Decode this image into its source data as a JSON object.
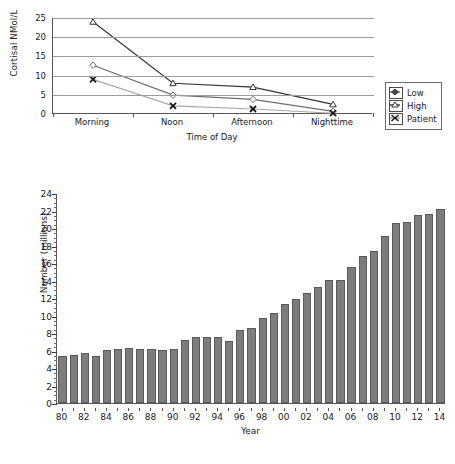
{
  "figure": {
    "partial_title": "",
    "background_color": "#ffffff"
  },
  "line_chart": {
    "ylabel": "Cortisal NMol/L",
    "xlabel": "Time of Day",
    "yticks": [
      "0",
      "5",
      "10",
      "15",
      "20",
      "25"
    ],
    "categories": [
      "Morning",
      "Noon",
      "Afternoon",
      "Nighttime"
    ],
    "legend": {
      "position": "right",
      "items": [
        {
          "label": "Low",
          "marker": "diamond-marker-icon",
          "color": "#6e6e6e"
        },
        {
          "label": "High",
          "marker": "triangle-marker-icon",
          "color": "#333333"
        },
        {
          "label": "Patient",
          "marker": "x-marker-icon",
          "color": "#a8a8a8"
        }
      ]
    }
  },
  "bar_chart": {
    "ylabel": "Number (millions)",
    "xlabel": "Year",
    "yticks": [
      "0",
      "2",
      "4",
      "6",
      "8",
      "10",
      "12",
      "14",
      "16",
      "18",
      "20",
      "22",
      "24"
    ],
    "xtick_labels": [
      "80",
      "82",
      "84",
      "86",
      "88",
      "90",
      "92",
      "94",
      "96",
      "98",
      "00",
      "02",
      "04",
      "06",
      "08",
      "10",
      "12",
      "14"
    ],
    "bar_color": "#7d7d7d",
    "bar_border_color": "#5a5a5a"
  },
  "chart_data": [
    {
      "type": "line",
      "title": "",
      "xlabel": "Time of Day",
      "ylabel": "Cortisal NMol/L",
      "categories": [
        "Morning",
        "Noon",
        "Afternoon",
        "Nighttime"
      ],
      "ylim": [
        0,
        25
      ],
      "ytick_step": 5,
      "grid": true,
      "legend": [
        "Low",
        "High",
        "Patient"
      ],
      "legend_position": "right-outside",
      "series": [
        {
          "name": "High",
          "marker": "triangle",
          "color": "#333333",
          "values": [
            24.0,
            8.0,
            7.0,
            2.5
          ]
        },
        {
          "name": "Low",
          "marker": "diamond",
          "color": "#6e6e6e",
          "values": [
            12.7,
            4.9,
            3.8,
            0.7
          ]
        },
        {
          "name": "Patient",
          "marker": "x",
          "color": "#a8a8a8",
          "values": [
            9.0,
            2.1,
            1.3,
            0.2
          ]
        }
      ]
    },
    {
      "type": "bar",
      "title": "",
      "xlabel": "Year",
      "ylabel": "Number (millions)",
      "ylim": [
        0,
        24
      ],
      "ytick_step": 2,
      "grid": false,
      "categories": [
        "80",
        "81",
        "82",
        "83",
        "84",
        "85",
        "86",
        "87",
        "88",
        "89",
        "90",
        "91",
        "92",
        "93",
        "94",
        "95",
        "96",
        "97",
        "98",
        "99",
        "00",
        "01",
        "02",
        "03",
        "04",
        "05",
        "06",
        "07",
        "08",
        "09",
        "10",
        "11",
        "12",
        "13",
        "14"
      ],
      "values": [
        5.4,
        5.5,
        5.7,
        5.4,
        6.1,
        6.2,
        6.3,
        6.2,
        6.2,
        6.1,
        6.2,
        7.2,
        7.5,
        7.6,
        7.6,
        7.1,
        8.3,
        8.6,
        9.7,
        10.3,
        11.3,
        11.9,
        12.6,
        13.3,
        14.1,
        14.1,
        15.6,
        16.8,
        17.4,
        19.1,
        20.6,
        20.7,
        21.5,
        21.6,
        22.2
      ]
    }
  ]
}
